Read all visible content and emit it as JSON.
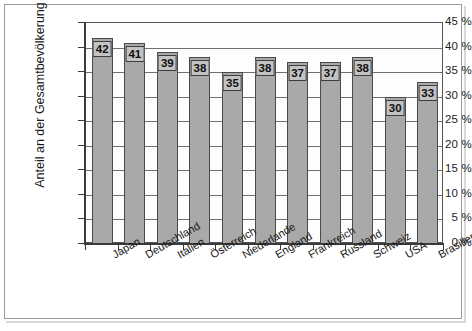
{
  "chart_data": {
    "type": "bar",
    "title": "",
    "subtitle": "",
    "xlabel": "",
    "ylabel": "Anteil an der Gesamtbevölkerung",
    "categories": [
      "Japan",
      "Deutschland",
      "Italien",
      "Österreich",
      "Niederlande",
      "England",
      "Frankreich",
      "Russland",
      "Schweiz",
      "USA",
      "Brasilien"
    ],
    "values": [
      42,
      41,
      39,
      38,
      35,
      38,
      37,
      37,
      38,
      30,
      33
    ],
    "data_labels": [
      "42",
      "41",
      "39",
      "38",
      "35",
      "38",
      "37",
      "37",
      "38",
      "30",
      "33"
    ],
    "ylim": [
      0,
      45
    ],
    "ytick_values": [
      0,
      5,
      10,
      15,
      20,
      25,
      30,
      35,
      40,
      45
    ],
    "ytick_labels": [
      "0 %",
      "5 %",
      "10 %",
      "15 %",
      "20 %",
      "25 %",
      "30 %",
      "35 %",
      "40 %",
      "45 %"
    ],
    "grid": true,
    "grid_axis": "y",
    "legend": false,
    "legend_position": "none",
    "bar_color": "#a9a9a9",
    "bar_border_color": "#4a4a4a",
    "label_box_color": "#c3c3c3",
    "axis_color": "#3a3a3a",
    "plot_background": "#fdfdfd",
    "figure_background": "#ffffff",
    "xtick_label_rotation": -30,
    "value_unit": "%"
  }
}
